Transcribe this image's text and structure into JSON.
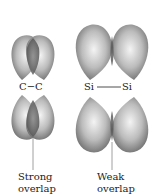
{
  "left": {
    "atom_label": "C−C",
    "caption_line1": "Strong",
    "caption_line2": "overlap"
  },
  "right": {
    "atom_label_left": "Si",
    "atom_label_right": "Si",
    "caption_line1": "Weak",
    "caption_line2": "overlap"
  },
  "colors": {
    "lobe_dark": "#6e6e6e",
    "lobe_light": "#f2f2f2",
    "overlap": "#5a5a5a",
    "line": "#888888"
  }
}
